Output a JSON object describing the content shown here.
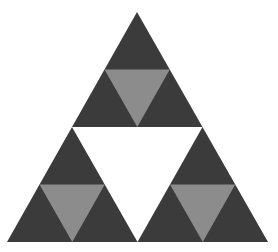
{
  "figure": {
    "colors": {
      "background": "#ffffff",
      "dark": "#3b3b3b",
      "light": "#8c8c8c",
      "hole": "#ffffff"
    },
    "geometry": {
      "apex": [
        137,
        12
      ],
      "base_left": [
        7,
        242
      ],
      "base_right": [
        268,
        242
      ]
    }
  }
}
